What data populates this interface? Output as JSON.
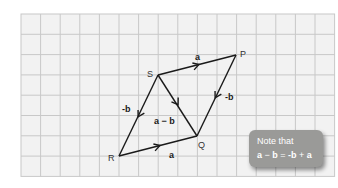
{
  "grid": {
    "x0": 21,
    "y0": 14,
    "cols": 16,
    "rows": 8,
    "cell_w": 19.6,
    "cell_h": 20.3,
    "line_color": "#c8c8c8",
    "fill_color": "#f2f2f2"
  },
  "points": {
    "S": {
      "label": "S",
      "x": 158,
      "y": 75
    },
    "P": {
      "label": "P",
      "x": 236,
      "y": 55
    },
    "Q": {
      "label": "Q",
      "x": 197,
      "y": 136
    },
    "R": {
      "label": "R",
      "x": 119,
      "y": 156
    }
  },
  "vectors": [
    {
      "from": "S",
      "to": "P",
      "label": "a"
    },
    {
      "from": "R",
      "to": "Q",
      "label": "a"
    },
    {
      "from": "S",
      "to": "R",
      "label": "-b"
    },
    {
      "from": "P",
      "to": "Q",
      "label": "-b"
    },
    {
      "from": "S",
      "to": "Q",
      "label": "a − b"
    }
  ],
  "labels": {
    "S": "S",
    "P": "P",
    "Q": "Q",
    "R": "R",
    "sp": "a",
    "rq": "a",
    "sr": "-b",
    "pq": "-b",
    "sq": "a − b"
  },
  "note": {
    "line1": "Note that",
    "eq_a": "a",
    "eq_minus": " − ",
    "eq_b": "b",
    "eq_equals": " = ",
    "eq_negb": "-b",
    "eq_plus": " + ",
    "eq_a2": "a",
    "bg_color": "#9a9a98"
  },
  "colors": {
    "vector": "#1a1a1a",
    "text": "#333333"
  }
}
